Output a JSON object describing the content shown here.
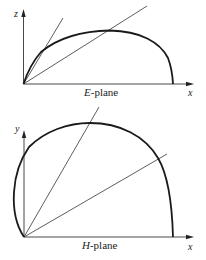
{
  "diagrams": [
    {
      "name": "E-plane",
      "caption_letter": "E",
      "caption_rest": "-plane",
      "x_axis_label": "x",
      "y_axis_label": "z"
    },
    {
      "name": "H-plane",
      "caption_letter": "H",
      "caption_rest": "-plane",
      "x_axis_label": "x",
      "y_axis_label": "y"
    }
  ],
  "colors": {
    "stroke": "#1a1a1a",
    "background": "#ffffff"
  }
}
